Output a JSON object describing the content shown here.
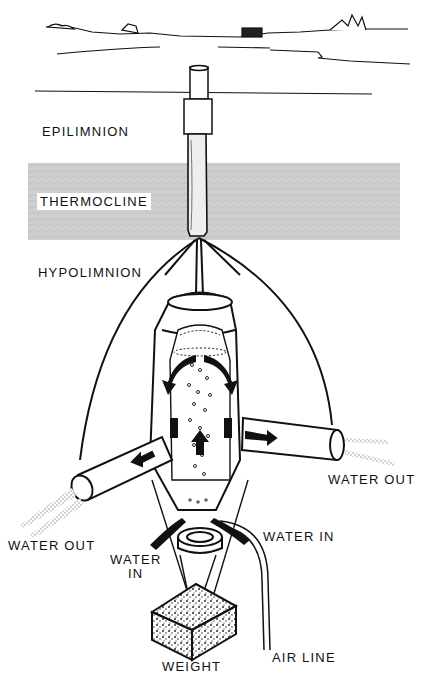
{
  "figure": {
    "type": "lake hypolimnion aerator illustration",
    "layers": {
      "epilimnion": "EPILIMNION",
      "thermocline": "THERMOCLINE",
      "hypolimnion": "HYPOLIMNION"
    },
    "labels": {
      "water_out_right": "WATER OUT",
      "water_out_left": "WATER OUT",
      "water_in_right": "WATER IN",
      "water_in_left_line1": "WATER",
      "water_in_left_line2": "IN",
      "weight": "WEIGHT",
      "air_line": "AIR LINE"
    },
    "colors": {
      "ink": "#111111",
      "thermocline_band": "#cfcfcf",
      "background": "#ffffff"
    },
    "caption_clipped": true
  }
}
